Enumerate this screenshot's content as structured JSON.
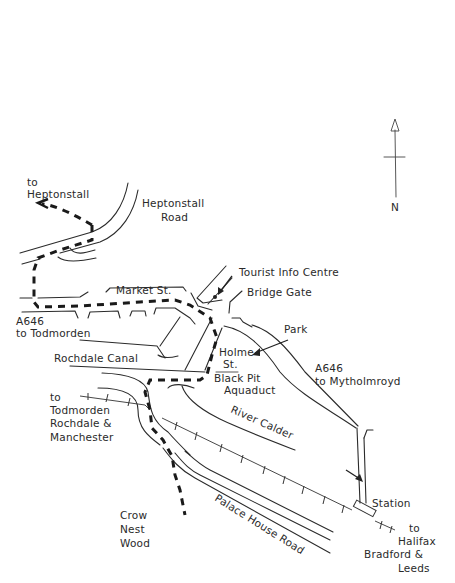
{
  "map": {
    "compass": {
      "label": "N",
      "icon": "north-arrow-icon"
    },
    "labels": {
      "to_heptonstall": [
        "to",
        "Heptonstall"
      ],
      "heptonstall_road": [
        "Heptonstall",
        "Road"
      ],
      "market_st": "Market St.",
      "tourist_info": "Tourist Info Centre",
      "bridge_gate": "Bridge Gate",
      "park": "Park",
      "a646_todmorden": [
        "A646",
        "to Todmorden"
      ],
      "rochdale_canal": "Rochdale Canal",
      "holme_st": [
        "Holme",
        "St."
      ],
      "black_pit": [
        "Black Pit",
        "Aquaduct"
      ],
      "a646_mytholmroyd": [
        "A646",
        "to Mytholmroyd"
      ],
      "to_todmorden_rochdale": [
        "to",
        "Todmorden",
        "Rochdale &",
        "Manchester"
      ],
      "river_calder": "River Calder",
      "crow_nest_wood": [
        "Crow",
        "Nest",
        "Wood"
      ],
      "palace_house_road": "Palace House Road",
      "station": "Station",
      "to_halifax": [
        "to",
        "Halifax",
        "Bradford &",
        "Leeds"
      ]
    },
    "colors": {
      "ink": "#2a2a2a",
      "route": "#1a1a1a",
      "paper": "#ffffff"
    }
  }
}
